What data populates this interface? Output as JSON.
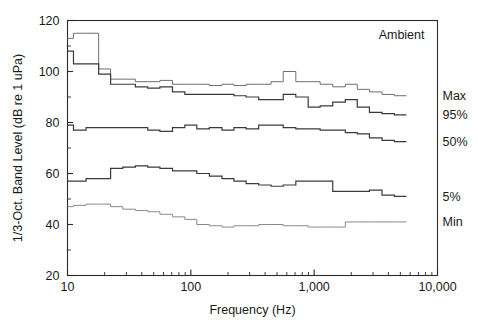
{
  "chart_data": {
    "type": "line",
    "title": "",
    "annotation": "Ambient",
    "xlabel": "Frequency (Hz)",
    "ylabel": "1/3-Oct. Band Level (dB re 1 uPa)",
    "xscale": "log",
    "xlim": [
      10,
      10000
    ],
    "ylim": [
      20,
      120
    ],
    "grid": false,
    "legend_position": "right-inline",
    "xticks": [
      10,
      100,
      1000,
      10000
    ],
    "xtick_labels": [
      "10",
      "100",
      "1,000",
      "10,000"
    ],
    "yticks": [
      20,
      40,
      60,
      80,
      100,
      120
    ],
    "ytick_labels": [
      "20",
      "40",
      "60",
      "80",
      "100",
      "120"
    ],
    "yticks_minor": [
      30,
      50,
      70,
      90,
      110
    ],
    "x": [
      10,
      12.5,
      16,
      20,
      25,
      31.5,
      40,
      50,
      63,
      80,
      100,
      125,
      160,
      200,
      250,
      315,
      400,
      500,
      630,
      800,
      1000,
      1250,
      1600,
      2000,
      2500,
      3150,
      4000,
      5000
    ],
    "series": [
      {
        "name": "Max",
        "label": "Max",
        "color": "#6f6f6f",
        "width": 1.0,
        "values": [
          113,
          115,
          115,
          101,
          97,
          97,
          96,
          96,
          96.5,
          95,
          95,
          95,
          94.5,
          95,
          94.5,
          95,
          95,
          96,
          100,
          96,
          96,
          95,
          94,
          95,
          93,
          92,
          91,
          90.5
        ]
      },
      {
        "name": "95%",
        "label": "95%",
        "color": "#3a3a3a",
        "width": 1.2,
        "values": [
          108,
          103,
          103,
          99,
          95,
          95,
          94,
          93.5,
          94,
          92,
          91,
          91,
          91,
          91,
          90.5,
          90,
          89,
          89,
          91,
          90,
          86,
          86.5,
          88,
          89,
          86,
          84,
          83.5,
          83
        ]
      },
      {
        "name": "50%",
        "label": "50%",
        "color": "#3a3a3a",
        "width": 1.2,
        "values": [
          79,
          77,
          78,
          78,
          78,
          78,
          78,
          77,
          76.5,
          78,
          79,
          77.5,
          78,
          77,
          78,
          77.5,
          79,
          79,
          78,
          77.5,
          77.5,
          77,
          77,
          76,
          75.5,
          74,
          73,
          72.5
        ]
      },
      {
        "name": "5%",
        "label": "5%",
        "color": "#3a3a3a",
        "width": 1.2,
        "values": [
          57,
          57,
          58,
          58,
          62,
          62.5,
          63,
          62.5,
          62,
          61,
          61,
          60,
          59,
          58,
          57,
          56,
          55.5,
          55,
          55.5,
          57,
          57,
          57,
          53,
          53,
          53,
          53.5,
          51.5,
          51
        ]
      },
      {
        "name": "Min",
        "label": "Min",
        "color": "#8a8a8a",
        "width": 1.0,
        "values": [
          47,
          47.5,
          48,
          48,
          47,
          46,
          45.5,
          45,
          44,
          43,
          42,
          40,
          39.5,
          39,
          39.5,
          39.5,
          40,
          40,
          39.5,
          39.5,
          39,
          39,
          39,
          41,
          41,
          41,
          41,
          41
        ]
      }
    ]
  }
}
